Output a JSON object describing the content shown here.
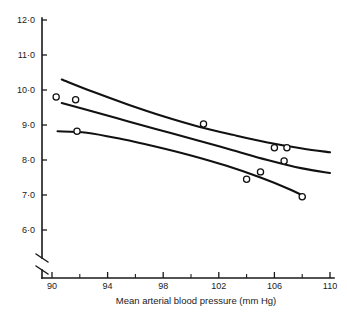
{
  "chart_data": {
    "type": "scatter",
    "title": "",
    "subtitle": "",
    "xlabel": "Mean arterial blood pressure (mm Hg)",
    "ylabel": "",
    "xlim": [
      90,
      110
    ],
    "ylim": [
      6.0,
      12.0
    ],
    "grid": false,
    "legend": null,
    "axis_break": {
      "axis": "y",
      "note": "broken y-axis below 6.0"
    },
    "x_ticks": [
      {
        "value": 90,
        "label": "90",
        "major": true
      },
      {
        "value": 92,
        "label": "",
        "major": false
      },
      {
        "value": 94,
        "label": "94",
        "major": true
      },
      {
        "value": 96,
        "label": "",
        "major": false
      },
      {
        "value": 98,
        "label": "98",
        "major": true
      },
      {
        "value": 100,
        "label": "",
        "major": false
      },
      {
        "value": 102,
        "label": "102",
        "major": true
      },
      {
        "value": 104,
        "label": "",
        "major": false
      },
      {
        "value": 106,
        "label": "106",
        "major": true
      },
      {
        "value": 108,
        "label": "",
        "major": false
      },
      {
        "value": 110,
        "label": "110",
        "major": true
      }
    ],
    "y_ticks": [
      {
        "value": 12.0,
        "label": "12·0"
      },
      {
        "value": 11.0,
        "label": "11·0"
      },
      {
        "value": 10.0,
        "label": "10·0"
      },
      {
        "value": 9.0,
        "label": "9·0"
      },
      {
        "value": 8.0,
        "label": "8·0"
      },
      {
        "value": 7.0,
        "label": "7·0"
      },
      {
        "value": 6.0,
        "label": "6·0"
      }
    ],
    "points": [
      {
        "x": 90.3,
        "y": 9.8
      },
      {
        "x": 91.7,
        "y": 9.72
      },
      {
        "x": 91.8,
        "y": 8.82
      },
      {
        "x": 100.9,
        "y": 9.03
      },
      {
        "x": 104.0,
        "y": 7.45
      },
      {
        "x": 105.0,
        "y": 7.66
      },
      {
        "x": 106.0,
        "y": 8.35
      },
      {
        "x": 106.7,
        "y": 7.97
      },
      {
        "x": 106.9,
        "y": 8.35
      },
      {
        "x": 108.0,
        "y": 6.95
      }
    ],
    "series": [
      {
        "name": "upper-curve",
        "type": "line",
        "points": [
          {
            "x": 90.7,
            "y": 10.3
          },
          {
            "x": 93.0,
            "y": 9.94
          },
          {
            "x": 95.5,
            "y": 9.58
          },
          {
            "x": 98.0,
            "y": 9.25
          },
          {
            "x": 100.5,
            "y": 8.96
          },
          {
            "x": 103.0,
            "y": 8.72
          },
          {
            "x": 105.5,
            "y": 8.5
          },
          {
            "x": 108.0,
            "y": 8.33
          },
          {
            "x": 110.0,
            "y": 8.22
          }
        ]
      },
      {
        "name": "middle-curve",
        "type": "line",
        "points": [
          {
            "x": 90.7,
            "y": 9.63
          },
          {
            "x": 93.0,
            "y": 9.38
          },
          {
            "x": 95.5,
            "y": 9.1
          },
          {
            "x": 98.0,
            "y": 8.83
          },
          {
            "x": 100.5,
            "y": 8.56
          },
          {
            "x": 103.0,
            "y": 8.28
          },
          {
            "x": 105.5,
            "y": 8.0
          },
          {
            "x": 108.0,
            "y": 7.76
          },
          {
            "x": 110.0,
            "y": 7.63
          }
        ]
      },
      {
        "name": "lower-curve",
        "type": "line",
        "points": [
          {
            "x": 90.4,
            "y": 8.82
          },
          {
            "x": 92.5,
            "y": 8.78
          },
          {
            "x": 95.0,
            "y": 8.6
          },
          {
            "x": 97.5,
            "y": 8.38
          },
          {
            "x": 100.0,
            "y": 8.13
          },
          {
            "x": 102.5,
            "y": 7.84
          },
          {
            "x": 105.0,
            "y": 7.5
          },
          {
            "x": 107.0,
            "y": 7.18
          },
          {
            "x": 108.2,
            "y": 6.95
          }
        ]
      }
    ]
  }
}
